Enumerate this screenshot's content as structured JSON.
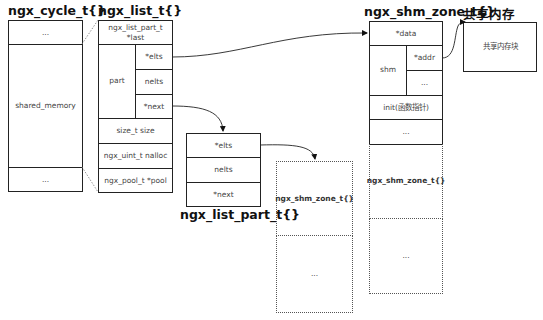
{
  "titles": {
    "cycle": "ngx_cycle_t{}",
    "list": "ngx_list_t{}",
    "list_part": "ngx_list_part_t{}",
    "shm_zone": "ngx_shm_zone_t{}",
    "shared_mem": "共享内存"
  },
  "cycle": {
    "rows": [
      "...",
      "shared_memory",
      "..."
    ]
  },
  "list": {
    "last": "ngx_list_part_t\n*last",
    "part_label": "part",
    "part_fields": [
      "*elts",
      "nelts",
      "*next"
    ],
    "size": "size_t size",
    "nalloc": "ngx_uint_t nalloc",
    "pool": "ngx_pool_t *pool"
  },
  "list_part": {
    "rows": [
      "*elts",
      "nelts",
      "*next"
    ]
  },
  "middle_array": {
    "rows": [
      "ngx_shm_zone_t{}",
      "..."
    ]
  },
  "shm_zone": {
    "data": "*data",
    "shm_label": "shm",
    "shm_fields": [
      "*addr",
      "..."
    ],
    "init": "init(函数指针)",
    "more": "...",
    "array_rows": [
      "ngx_shm_zone_t{}",
      "..."
    ]
  },
  "shared_mem": {
    "block": "共享内存块"
  }
}
